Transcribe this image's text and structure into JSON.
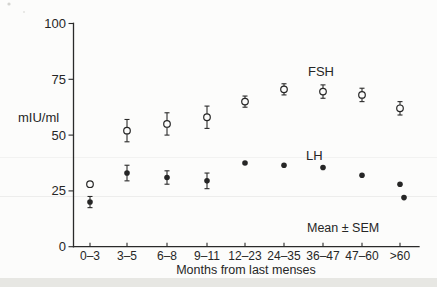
{
  "figure": {
    "background": "#fcfcfb",
    "ink_color": "#262626"
  },
  "chart_data": {
    "type": "scatter",
    "title": "",
    "ylabel": "mIU/ml",
    "xlabel": "Months from last menses",
    "note": "Mean ± SEM",
    "ylim": [
      0,
      100
    ],
    "yticks": [
      0,
      25,
      50,
      75,
      100
    ],
    "categories": [
      "0–3",
      "3–5",
      "6–8",
      "9–11",
      "12–23",
      "24–35",
      "36–47",
      "47–60",
      ">60"
    ],
    "series": [
      {
        "name": "FSH",
        "marker": "open-circle",
        "values": [
          28,
          52,
          55,
          58,
          65,
          70.5,
          69.5,
          68,
          62
        ],
        "sem": [
          null,
          5,
          5,
          5,
          2.5,
          2.5,
          3,
          3,
          3
        ]
      },
      {
        "name": "LH",
        "marker": "filled-circle",
        "values": [
          20,
          33,
          31,
          29.5,
          37.5,
          36.5,
          35.5,
          32,
          28
        ],
        "sem": [
          2.5,
          3.5,
          3,
          3.5,
          null,
          null,
          null,
          null,
          null
        ]
      }
    ],
    "extra_points": [
      {
        "series": "LH",
        "category": ">60",
        "value": 22
      }
    ],
    "grid": false,
    "legend_position": "inline-labels"
  }
}
